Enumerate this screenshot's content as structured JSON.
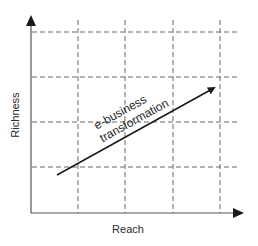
{
  "diagram": {
    "type": "2x2-style grid diagram",
    "x_axis_label": "Reach",
    "y_axis_label": "Richness",
    "arrow_label_line1": "e-business",
    "arrow_label_line2": "transformation",
    "grid": {
      "vertical_lines_x": [
        78,
        125,
        173,
        220
      ],
      "horizontal_lines_y": [
        32,
        77,
        122,
        167
      ],
      "style": "dashed"
    },
    "arrow": {
      "from": [
        57,
        175
      ],
      "to": [
        218,
        86
      ]
    },
    "colors": {
      "axis": "#555555",
      "grid": "#6a6a6a",
      "arrow": "#1a1a1a",
      "text": "#2a2a2a"
    }
  }
}
